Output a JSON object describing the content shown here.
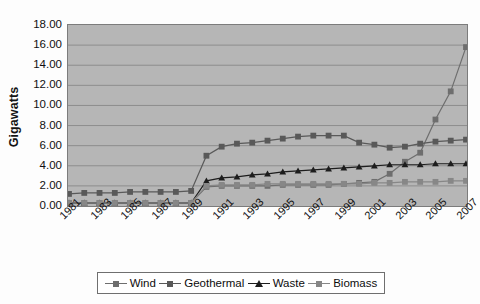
{
  "chart_data": {
    "type": "line",
    "title": "",
    "xlabel": "",
    "ylabel": "Gigawatts",
    "ylim": [
      0,
      18
    ],
    "ytick_step": 2,
    "grid": true,
    "legend_position": "bottom",
    "yticks": [
      "18.00",
      "16.00",
      "14.00",
      "12.00",
      "10.00",
      "8.00",
      "6.00",
      "4.00",
      "2.00",
      "0.00"
    ],
    "x": [
      1981,
      1982,
      1983,
      1984,
      1985,
      1986,
      1987,
      1988,
      1989,
      1990,
      1991,
      1992,
      1993,
      1994,
      1995,
      1996,
      1997,
      1998,
      1999,
      2000,
      2001,
      2002,
      2003,
      2004,
      2005,
      2006,
      2007
    ],
    "xtick_labels": [
      "1981",
      "1983",
      "1985",
      "1987",
      "1989",
      "1991",
      "1993",
      "1995",
      "1997",
      "1999",
      "2001",
      "2003",
      "2005",
      "2007"
    ],
    "series": [
      {
        "name": "Wind",
        "color": "#6e6e6e",
        "marker": "square",
        "values": [
          0.3,
          0.3,
          0.3,
          0.3,
          0.3,
          0.3,
          0.3,
          0.3,
          0.3,
          1.9,
          2.0,
          2.0,
          2.0,
          2.0,
          2.1,
          2.1,
          2.1,
          2.1,
          2.2,
          2.3,
          2.4,
          3.2,
          4.4,
          5.3,
          8.6,
          11.4,
          15.8
        ]
      },
      {
        "name": "Geothermal",
        "color": "#595959",
        "marker": "square",
        "values": [
          1.2,
          1.3,
          1.3,
          1.3,
          1.4,
          1.4,
          1.4,
          1.4,
          1.5,
          5.0,
          5.9,
          6.2,
          6.3,
          6.5,
          6.7,
          6.9,
          7.0,
          7.0,
          7.0,
          6.3,
          6.1,
          5.8,
          5.9,
          6.2,
          6.4,
          6.5,
          6.6
        ]
      },
      {
        "name": "Waste",
        "color": "#1d1d1d",
        "marker": "triangle",
        "values": [
          0.3,
          0.3,
          0.3,
          0.3,
          0.3,
          0.3,
          0.3,
          0.3,
          0.3,
          2.5,
          2.8,
          2.9,
          3.1,
          3.2,
          3.4,
          3.5,
          3.6,
          3.7,
          3.8,
          3.9,
          4.0,
          4.1,
          4.1,
          4.1,
          4.2,
          4.2,
          4.2
        ]
      },
      {
        "name": "Biomass",
        "color": "#878787",
        "marker": "square",
        "values": [
          0.3,
          0.3,
          0.3,
          0.3,
          0.3,
          0.3,
          0.3,
          0.3,
          0.3,
          2.0,
          2.1,
          2.1,
          2.1,
          2.2,
          2.2,
          2.2,
          2.2,
          2.2,
          2.2,
          2.2,
          2.3,
          2.3,
          2.4,
          2.4,
          2.4,
          2.5,
          2.5
        ]
      }
    ]
  }
}
